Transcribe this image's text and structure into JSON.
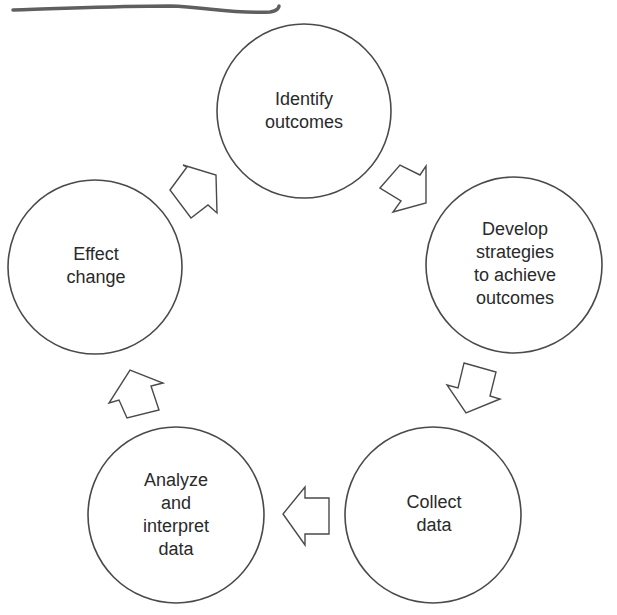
{
  "diagram": {
    "type": "cycle",
    "stroke_color": "#4a4a4a",
    "underline_color": "#5a5a5a",
    "nodes": [
      {
        "id": "identify-outcomes",
        "label": "Identify\noutcomes",
        "cx": 304,
        "cy": 111,
        "r": 87
      },
      {
        "id": "develop-strategies",
        "label": "Develop\nstrategies\nto achieve\noutcomes",
        "cx": 514,
        "cy": 265,
        "r": 88
      },
      {
        "id": "collect-data",
        "label": "Collect\ndata",
        "cx": 433,
        "cy": 515,
        "r": 88
      },
      {
        "id": "analyze-interpret-data",
        "label": "Analyze\nand\ninterpret\ndata",
        "cx": 176,
        "cy": 515,
        "r": 88
      },
      {
        "id": "effect-change",
        "label": "Effect\nchange",
        "cx": 95,
        "cy": 267,
        "r": 87
      }
    ],
    "edges": [
      {
        "from": "identify-outcomes",
        "to": "develop-strategies"
      },
      {
        "from": "develop-strategies",
        "to": "collect-data"
      },
      {
        "from": "collect-data",
        "to": "analyze-interpret-data"
      },
      {
        "from": "analyze-interpret-data",
        "to": "effect-change"
      },
      {
        "from": "effect-change",
        "to": "identify-outcomes"
      }
    ]
  }
}
